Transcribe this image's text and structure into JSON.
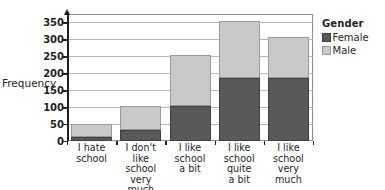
{
  "chart_data": {
    "type": "bar",
    "subtype": "stacked",
    "title": "",
    "xlabel": "",
    "ylabel": "Frequency",
    "categories": [
      "I hate school",
      "I don't like school very much",
      "I like school a bit",
      "I like school quite a bit",
      "I like school very much"
    ],
    "category_lines": [
      [
        "I hate",
        "school"
      ],
      [
        "I don't",
        "like",
        "school",
        "very much"
      ],
      [
        "I like",
        "school",
        "a bit"
      ],
      [
        "I like",
        "school",
        "quite",
        "a bit"
      ],
      [
        "I like",
        "school",
        "very",
        "much"
      ]
    ],
    "series": [
      {
        "name": "Female",
        "color": "#595959",
        "values": [
          12,
          33,
          103,
          185,
          187
        ]
      },
      {
        "name": "Male",
        "color": "#c9c9c9",
        "values": [
          38,
          69,
          150,
          169,
          120
        ]
      }
    ],
    "totals": [
      50,
      102,
      253,
      354,
      307
    ],
    "ylim": [
      0,
      375
    ],
    "yticks": [
      0,
      50,
      100,
      150,
      200,
      250,
      300,
      350
    ],
    "ytick_labels": [
      "0",
      "50",
      "100",
      "150",
      "200",
      "250",
      "300",
      "350"
    ],
    "grid": true,
    "grid_axis": "y",
    "legend": {
      "title": "Gender",
      "position": "right",
      "entries": [
        {
          "label": "Female",
          "color": "#595959"
        },
        {
          "label": "Male",
          "color": "#c9c9c9"
        }
      ]
    }
  },
  "colors": {
    "female": "#595959",
    "male": "#c9c9c9",
    "axis": "#231f20",
    "grid": "#b7b7b7",
    "frame": "#8d8d8d",
    "background": "#ffffff"
  }
}
